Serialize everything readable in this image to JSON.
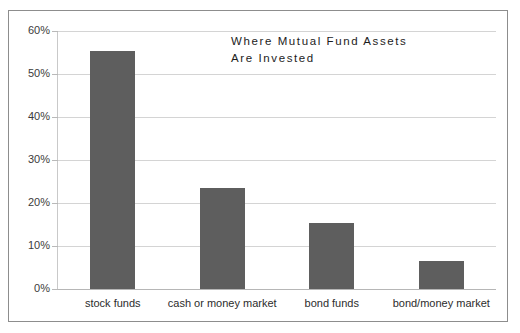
{
  "chart_data": {
    "type": "bar",
    "title": "Where Mutual Fund Assets\nAre Invested",
    "title_line1": "Where Mutual Fund Assets",
    "title_line2": "Are Invested",
    "xlabel": "",
    "ylabel": "",
    "categories": [
      "stock funds",
      "cash or money market",
      "bond funds",
      "bond/money market"
    ],
    "values": [
      55.3,
      23.4,
      15.4,
      6.4
    ],
    "value_labels": [
      "55.3%",
      "23.4%",
      "15.4%",
      "6.4%"
    ],
    "ylim": [
      0,
      60
    ],
    "ytick_values": [
      0,
      10,
      20,
      30,
      40,
      50,
      60
    ],
    "ytick_labels": [
      "0%",
      "10%",
      "20%",
      "30%",
      "40%",
      "50%",
      "60%"
    ],
    "grid": true,
    "legend": false,
    "legend_position": "none",
    "series": [
      {
        "name": "Share of assets",
        "values": [
          55.3,
          23.4,
          15.4,
          6.4
        ]
      }
    ],
    "colors": {
      "bar_fill": "#5e5e5e",
      "gridline": "#d4d4d4",
      "axis": "#c9c9c9",
      "frame_border": "#8d8d8d",
      "background": "#ffffff",
      "tick_text": "#3b3b3b",
      "title_text": "#1c1c1c"
    }
  }
}
